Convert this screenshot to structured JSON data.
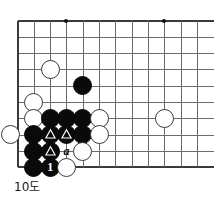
{
  "diagram": {
    "caption": "10도",
    "kind": "go-board-problem-diagram",
    "board": {
      "cols": 12,
      "rows": 10,
      "origin_x": 17.5,
      "origin_y": 20.5,
      "spacing": 16.33,
      "left_edge": true,
      "top_edge": true,
      "bottom_edge": true,
      "right_edge": false,
      "line_color": "#6b6b6b",
      "edge_color": "#3a3a3a",
      "background": "#ffffff"
    },
    "star_points": [
      {
        "col": 4,
        "row": 1
      },
      {
        "col": 10,
        "row": 1
      },
      {
        "col": 10,
        "row": 7
      }
    ],
    "stones": [
      {
        "id": "w-c3r4",
        "color": "white",
        "col": 3,
        "row": 4,
        "mark": "none"
      },
      {
        "id": "b-c5r5",
        "color": "black",
        "col": 5,
        "row": 5,
        "mark": "none"
      },
      {
        "id": "w-c2r6",
        "color": "white",
        "col": 2,
        "row": 6,
        "mark": "none"
      },
      {
        "id": "w-c2r7",
        "color": "white",
        "col": 2,
        "row": 7,
        "mark": "none"
      },
      {
        "id": "b-c3r7",
        "color": "black",
        "col": 3,
        "row": 7,
        "mark": "none"
      },
      {
        "id": "b-c4r7",
        "color": "black",
        "col": 4,
        "row": 7,
        "mark": "none"
      },
      {
        "id": "b-c5r7",
        "color": "black",
        "col": 5,
        "row": 7,
        "mark": "none"
      },
      {
        "id": "w-c6r7",
        "color": "white",
        "col": 6,
        "row": 7,
        "mark": "none"
      },
      {
        "id": "w-c10r7",
        "color": "white",
        "col": 10,
        "row": 7,
        "mark": "none"
      },
      {
        "id": "w-c1r8",
        "color": "white",
        "col": 0.6,
        "row": 8,
        "mark": "none"
      },
      {
        "id": "b-c2r8",
        "color": "black",
        "col": 2,
        "row": 8,
        "mark": "none"
      },
      {
        "id": "b-c3r8",
        "color": "black",
        "col": 3,
        "row": 8,
        "mark": "triangle"
      },
      {
        "id": "b-c4r8",
        "color": "black",
        "col": 4,
        "row": 8,
        "mark": "triangle"
      },
      {
        "id": "b-c5r8",
        "color": "black",
        "col": 5,
        "row": 8,
        "mark": "none"
      },
      {
        "id": "w-c6r8",
        "color": "white",
        "col": 6,
        "row": 8,
        "mark": "none"
      },
      {
        "id": "b-c2r9",
        "color": "black",
        "col": 2,
        "row": 9,
        "mark": "none"
      },
      {
        "id": "b-c3r9",
        "color": "black",
        "col": 3,
        "row": 9,
        "mark": "triangle"
      },
      {
        "id": "w-c5r9",
        "color": "white",
        "col": 5,
        "row": 9,
        "mark": "none"
      },
      {
        "id": "b-c2r10",
        "color": "black",
        "col": 2,
        "row": 10,
        "mark": "none"
      },
      {
        "id": "b-c3r10",
        "color": "black",
        "col": 3,
        "row": 10,
        "mark": "number",
        "number": "1"
      },
      {
        "id": "w-c4r10",
        "color": "white",
        "col": 4,
        "row": 10,
        "mark": "none"
      }
    ],
    "labels": [
      {
        "id": "label-a",
        "text": "a",
        "col": 4,
        "row": 9
      }
    ]
  }
}
